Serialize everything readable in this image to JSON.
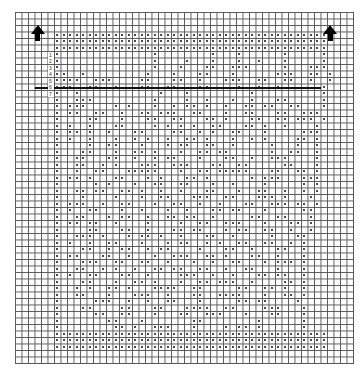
{
  "chart_data": {
    "type": "table",
    "grid": {
      "cols": 52,
      "rows": 54,
      "cell_px": 6.5,
      "left": 15,
      "top": 12
    },
    "legend": {
      "dot": "filled block",
      "empty": "open mesh"
    },
    "direction_arrows": [
      {
        "col": 3,
        "row": 2,
        "label": "up"
      },
      {
        "col": 48,
        "row": 2,
        "label": "up"
      }
    ],
    "heavy_line": {
      "row": 11.6,
      "col_start": 3,
      "col_end": 47
    },
    "row_numbers": [
      "1",
      "2",
      "3",
      "4",
      "5",
      "6",
      "7"
    ],
    "filled_rows": [
      "",
      "",
      "",
      "      ##########################################",
      "      ##########################################",
      "      ##########################################",
      "      #              #        #   #      #     #",
      "      #              #    #   #   #  #   #     #",
      "      #              #   #   ##  ###     #   ###",
      "      ##  #         #   #   ##   #      ###  ## #",
      "      ####  ###    ##   ##  #   ###  ##  ##  #  #",
      "      ###  ##  #   ##  ##   ##    #  #  #      #",
      "      #  #            #   #         #          #",
      "      #  ###         #    #  #   #  #   ##     #",
      "      # ###    # #   #  # ## #  #  ## ##  ##   #",
      "      # ##  ##  #  ## ###  ##   #  ##   ##  ###",
      "      #    ##   #   ##  ##   ## #   ##  ## ### #",
      "      # #  #   ##    # # # #  ##   ## #  #    #",
      "      # ## #  #   ##    ##  # #  ##   #     ###",
      "      # #  #   #  # #  #  ## #   #  # #    ## #",
      "      #    #  ##   #   # ##  ##  #     #   #  #",
      "      #   ##   #  ## #   #  ## ##      #  ##  #",
      "      #  ##   ##  #  # ##   #   ##  #  ###    #",
      "      #  ##  # #   ###  ###   ##  ##     ##   #",
      "      #  #  ##   #####   #  ## #####   ##  ## #",
      "      # ## #   ##   # #   ## #      # ###   ###",
      "      #     # #   #  ##  ##   #  #    #     # #",
      "      #  ## ##  ## #  #  #   ##   #  ##  #  # #",
      "      #   #    #   #  ##   ###  ##   ### #   #",
      "      # ###  #  ##   #  ##  #  #   ##  ### ## #",
      "      # #  ##   #  #   #  #   ## ##   #     ##",
      "      #  ##   # ##  #  ## ##  #     ##  ##   #",
      "      # ## ##  #    #    #  ##  ###   #   ## #",
      "      #    ##   ##  #   ## ##   # ##  ##  #  #",
      "      #  ### #   # ## #  #   ##  #     #   ##",
      "      # #  #  ##   #   # ##  # #  ##  ##  # #",
      "      #   ##  # ##  # ##    #   ##  #   ##  #",
      "      # ##   ##  #   #  ###  ## #   ##  #   #",
      "      #   ###  ##  ##  #   #  #  ##   # ### #",
      "      #  ##  # #  #  ## ##  ##  #  ##   #   #",
      "      # #  ##   ##  #    ###  #  #   ## ##  #",
      "      #   ##   #  ## #   #  ## ###  #    ## #",
      "      #  # #  ## #   ####  ##     ##  ## #  #",
      "      #  ##   #   ###  #   ##  ####   #  ## #",
      "      #     ###  #  #  ##   #     ## ##    #",
      "      #   ##    ##   ##   ####  ##    ###   #",
      "      #     ##  ##   #   ##  ###   #   ##   #",
      "      #       ##   #       ##        #      #",
      "      #        ## #  ###   #    # ## #      #",
      "      ##########################################",
      "      ##########################################",
      "      ##########################################",
      "",
      ""
    ]
  },
  "caption": "Filet crochet chart"
}
